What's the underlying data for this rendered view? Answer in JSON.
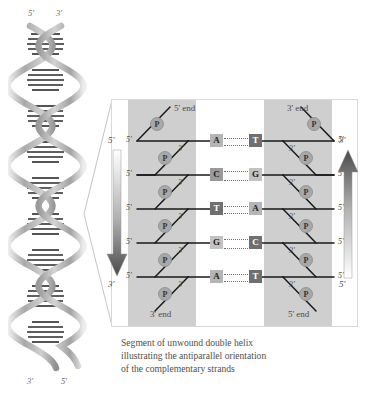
{
  "figure": {
    "caption_lines": [
      "Segment of unwound double helix",
      "illustrating the antiparallel orientation",
      "of the complementary strands"
    ]
  },
  "helix": {
    "top_left_label": "5'",
    "top_right_label": "3'",
    "bottom_left_label": "3'",
    "bottom_right_label": "5'"
  },
  "panel": {
    "left_strand": {
      "top_end_label": "5' end",
      "bottom_end_label": "3' end",
      "sugar_left_labels": [
        "5'",
        "5'",
        "5'",
        "5'",
        "5'"
      ],
      "sugar_right_labels": [
        "3'",
        "3'",
        "3'",
        "3'",
        "3'"
      ],
      "phosphate_label": "P",
      "phosphate_count": 6
    },
    "right_strand": {
      "top_end_label": "3' end",
      "bottom_end_label": "5' end",
      "sugar_left_labels": [
        "3'",
        "3'",
        "3'",
        "3'",
        "3'"
      ],
      "sugar_right_labels": [
        "5'",
        "5'",
        "5'",
        "5'",
        "5'"
      ],
      "phosphate_label": "P",
      "phosphate_count": 6
    },
    "base_pairs": [
      {
        "left": "A",
        "right": "T"
      },
      {
        "left": "C",
        "right": "G"
      },
      {
        "left": "T",
        "right": "A"
      },
      {
        "left": "G",
        "right": "C"
      },
      {
        "left": "A",
        "right": "T"
      }
    ],
    "left_arrow": {
      "top_label": "5'",
      "bottom_label": "3'",
      "direction": "down"
    },
    "right_arrow": {
      "top_label": "3'",
      "bottom_label": "5'",
      "direction": "up"
    }
  },
  "colors": {
    "band_gray": "#cfcfcf",
    "phosphate_gray": "#a8a8a8",
    "base_light": "#b5b5b5",
    "base_dark": "#6f6f6f",
    "backbone_line": "#1a1a1a",
    "panel_border": "#d9d9d9",
    "text_gray": "#4d4d4d",
    "arrow_dark": "#555555"
  }
}
